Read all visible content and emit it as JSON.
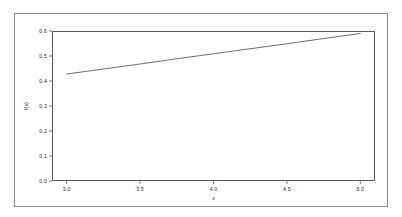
{
  "chart_data": {
    "type": "line",
    "title": "",
    "subtitle": "",
    "xlabel": "x",
    "ylabel": "f(x)",
    "xlim": [
      2.9,
      5.1
    ],
    "ylim": [
      0.0,
      0.6
    ],
    "grid": false,
    "legend": null,
    "legend_position": "none",
    "xticks": [
      3.0,
      3.5,
      4.0,
      4.5,
      5.0
    ],
    "xtick_labels": [
      "3.0",
      "3.5",
      "4.0",
      "4.5",
      "5.0"
    ],
    "yticks": [
      0.0,
      0.1,
      0.2,
      0.3,
      0.4,
      0.5,
      0.6
    ],
    "ytick_labels": [
      "0.0",
      "0.1",
      "0.2",
      "0.3",
      "0.4",
      "0.5",
      "0.6"
    ],
    "series": [
      {
        "name": "f(x)",
        "color": "#4a4a4a",
        "linewidth": 0.8,
        "x": [
          3.0,
          3.25,
          3.5,
          3.75,
          4.0,
          4.25,
          4.5,
          4.75,
          5.0
        ],
        "values": [
          0.428,
          0.448,
          0.468,
          0.489,
          0.509,
          0.529,
          0.549,
          0.57,
          0.59
        ]
      }
    ],
    "annotations": []
  },
  "figure": {
    "background_color": "#ffffff",
    "outer_border_color": "#8a8a8a",
    "plot_frame_color": "#5a5a5a",
    "tick_color": "#5a5a5a",
    "text_color": "#2a2a2a"
  }
}
